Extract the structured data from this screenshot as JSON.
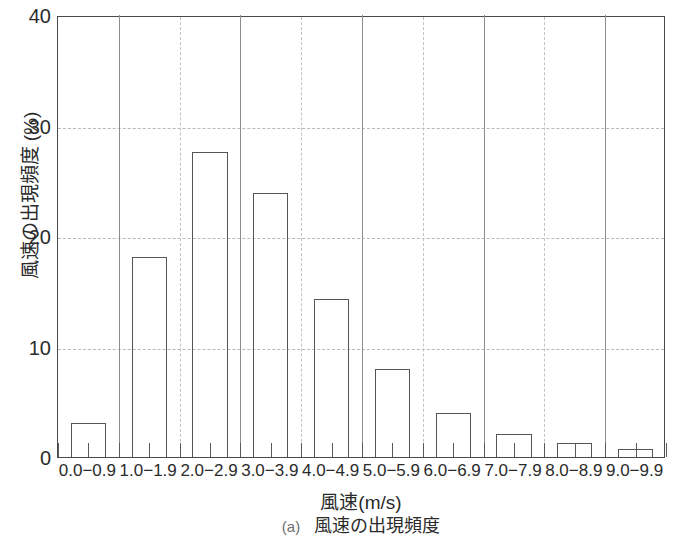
{
  "chart_data": {
    "type": "bar",
    "title": "",
    "caption_tag": "(a)",
    "caption_text": "風速の出現頻度",
    "xlabel": "風速(m/s)",
    "ylabel": "風速の出現頻度 (%)",
    "categories": [
      "0.0−0.9",
      "1.0−1.9",
      "2.0−2.9",
      "3.0−3.9",
      "4.0−4.9",
      "5.0−5.9",
      "6.0−6.9",
      "7.0−7.9",
      "8.0−8.9",
      "9.0−9.9"
    ],
    "values": [
      3.1,
      18.1,
      27.6,
      23.9,
      14.3,
      8.0,
      4.0,
      2.1,
      1.3,
      0.7
    ],
    "ylim": [
      0,
      40
    ],
    "yticks": [
      0,
      10,
      20,
      30,
      40
    ],
    "ytick_labels": [
      "0",
      "10",
      "20",
      "30",
      "40"
    ],
    "grid": "horizontal-and-vertical-dashed",
    "legend": "none",
    "bar_style": {
      "fill": "none",
      "edge_color": "#555555",
      "edge_width": 1
    },
    "colors": {
      "axis": "#4a4a4a",
      "gridline": "#bbbbbb",
      "text": "#2b2b2b"
    }
  }
}
